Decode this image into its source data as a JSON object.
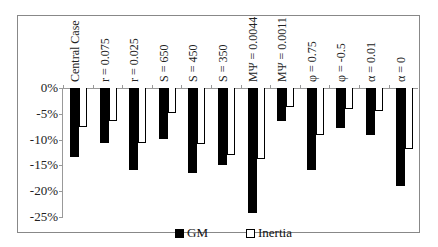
{
  "chart_data": {
    "type": "bar",
    "title": "",
    "xlabel": "",
    "ylabel": "",
    "ylim": [
      -25,
      0
    ],
    "yticks": [
      "0%",
      "-5%",
      "-10%",
      "-15%",
      "-20%",
      "-25%"
    ],
    "grid": false,
    "legend_position": "bottom",
    "categories": [
      "Central Case",
      "r = 0.075",
      "r = 0.025",
      "S = 650",
      "S = 450",
      "S = 350",
      "MΨ = 0.0044",
      "MΨ = 0.0011",
      "φ = 0.75",
      "φ = -0.5",
      "α = 0.01",
      "α = 0"
    ],
    "series": [
      {
        "name": "GM",
        "color": "#000000",
        "values": [
          -13.3,
          -10.6,
          -15.8,
          -9.9,
          -16.5,
          -15.0,
          -24.3,
          -6.4,
          -15.8,
          -7.7,
          -9.1,
          -18.9
        ]
      },
      {
        "name": "Inertia",
        "color": "#ffffff",
        "values": [
          -7.5,
          -6.3,
          -10.6,
          -4.9,
          -10.8,
          -12.9,
          -13.7,
          -3.6,
          -9.1,
          -4.1,
          -4.4,
          -11.8
        ]
      }
    ]
  },
  "legend": {
    "gm": "GM",
    "inertia": "Inertia"
  }
}
